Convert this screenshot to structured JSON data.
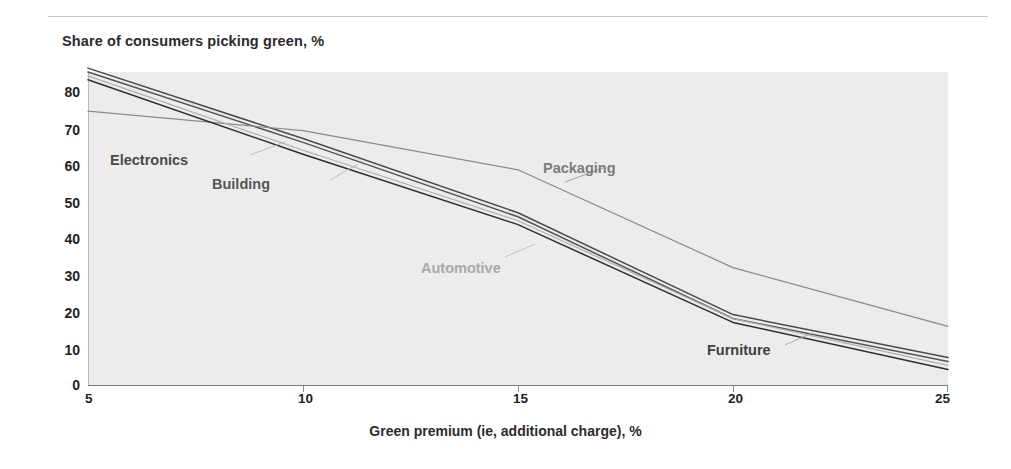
{
  "chart_title": "Share of consumers picking green, %",
  "axis": {
    "x_label": "Green premium (ie, additional charge), %",
    "y_ticks": [
      "80",
      "70",
      "60",
      "50",
      "40",
      "30",
      "20",
      "10",
      "0"
    ],
    "x_ticks": [
      "5",
      "10",
      "15",
      "20",
      "25"
    ]
  },
  "series_labels": {
    "electronics": "Electronics",
    "building": "Building",
    "packaging": "Packaging",
    "automotive": "Automotive",
    "furniture": "Furniture"
  },
  "colors": {
    "plot_background": "#ececec",
    "electronics": "#4a4a4a",
    "building": "#555555",
    "packaging": "#8a8a8a",
    "automotive": "#b0b0b0",
    "furniture": "#2e2e2e",
    "axis": "#7a7a7a",
    "text": "#1f1f1f"
  },
  "chart_data": {
    "type": "line",
    "title": "Share of consumers picking green, %",
    "xlabel": "Green premium (ie, additional charge), %",
    "ylabel": "Share of consumers picking green, %",
    "xlim": [
      5,
      25
    ],
    "ylim": [
      0,
      80
    ],
    "grid": false,
    "legend": "inline-labels",
    "x": [
      5,
      10,
      15,
      20,
      25
    ],
    "series": [
      {
        "name": "Electronics",
        "values": [
          81,
          63,
          44,
          18,
          7
        ]
      },
      {
        "name": "Building",
        "values": [
          80,
          62,
          43,
          17,
          6
        ]
      },
      {
        "name": "Packaging",
        "values": [
          70,
          65,
          55,
          30,
          15
        ]
      },
      {
        "name": "Automotive",
        "values": [
          79,
          60,
          42,
          17,
          5
        ]
      },
      {
        "name": "Furniture",
        "values": [
          78,
          59,
          41,
          16,
          4
        ]
      }
    ]
  }
}
